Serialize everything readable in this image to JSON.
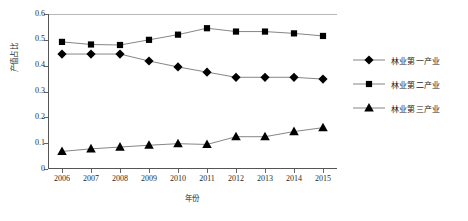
{
  "chart_data": {
    "type": "line",
    "title": "",
    "xlabel": "年份",
    "ylabel": "产值占比",
    "categories": [
      "2006",
      "2007",
      "2008",
      "2009",
      "2010",
      "2011",
      "2012",
      "2013",
      "2014",
      "2015"
    ],
    "ylim": [
      0,
      0.6
    ],
    "y_ticks": [
      "0",
      "0.1",
      "0.2",
      "0.3",
      "0.4",
      "0.5",
      "0.6"
    ],
    "y_tick_values": [
      0,
      0.1,
      0.2,
      0.3,
      0.4,
      0.5,
      0.6
    ],
    "grid": false,
    "legend_position": "right",
    "series": [
      {
        "name": "林业第一产业",
        "marker": "diamond",
        "color": "#000000",
        "line_color": "#777777",
        "values": [
          0.445,
          0.445,
          0.445,
          0.418,
          0.395,
          0.375,
          0.355,
          0.355,
          0.355,
          0.348
        ]
      },
      {
        "name": "林业第二产业",
        "marker": "square",
        "color": "#000000",
        "line_color": "#777777",
        "values": [
          0.492,
          0.482,
          0.48,
          0.5,
          0.52,
          0.545,
          0.532,
          0.532,
          0.525,
          0.515
        ]
      },
      {
        "name": "林业第三产业",
        "marker": "triangle",
        "color": "#000000",
        "line_color": "#777777",
        "values": [
          0.068,
          0.078,
          0.085,
          0.092,
          0.098,
          0.095,
          0.125,
          0.125,
          0.145,
          0.16
        ]
      }
    ]
  },
  "axes": {
    "y_title": "产值占比",
    "x_title": "年份"
  },
  "legend": {
    "items": [
      {
        "label": "林业第一产业",
        "marker": "diamond"
      },
      {
        "label": "林业第二产业",
        "marker": "square"
      },
      {
        "label": "林业第三产业",
        "marker": "triangle"
      }
    ]
  }
}
